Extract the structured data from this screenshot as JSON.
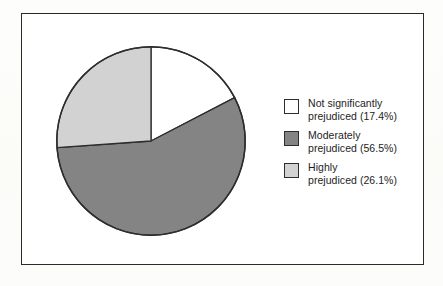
{
  "figure": {
    "background_color": "#fdfdfb",
    "frame_color": "#2b2b2b",
    "plot_background": "#ffffff"
  },
  "chart_data": {
    "type": "pie",
    "title": "",
    "subtitle": "",
    "xlabel": "",
    "ylabel": "",
    "legend_position": "right",
    "grid": false,
    "start_angle_deg": 0,
    "direction": "clockwise",
    "categories": [
      "Not significantly prejudiced",
      "Moderately prejudiced",
      "Highly prejudiced"
    ],
    "values": [
      17.4,
      56.5,
      26.1
    ],
    "value_unit": "%",
    "slices": [
      {
        "label": "Not significantly prejudiced",
        "value": 17.4,
        "value_text": "17.4%",
        "color": "#ffffff",
        "start_deg": 0.0,
        "end_deg": 62.6
      },
      {
        "label": "Moderately prejudiced",
        "value": 56.5,
        "value_text": "56.5%",
        "color": "#848484",
        "start_deg": 62.6,
        "end_deg": 266.0
      },
      {
        "label": "Highly prejudiced",
        "value": 26.1,
        "value_text": "26.1%",
        "color": "#d2d2d2",
        "start_deg": 266.0,
        "end_deg": 360.0
      }
    ]
  },
  "legend": {
    "items": [
      {
        "swatch_color": "#ffffff",
        "label": "Not significantly\nprejudiced (17.4%)"
      },
      {
        "swatch_color": "#848484",
        "label": "Moderately\nprejudiced (56.5%)"
      },
      {
        "swatch_color": "#d2d2d2",
        "label": "Highly\nprejudiced (26.1%)"
      }
    ]
  }
}
